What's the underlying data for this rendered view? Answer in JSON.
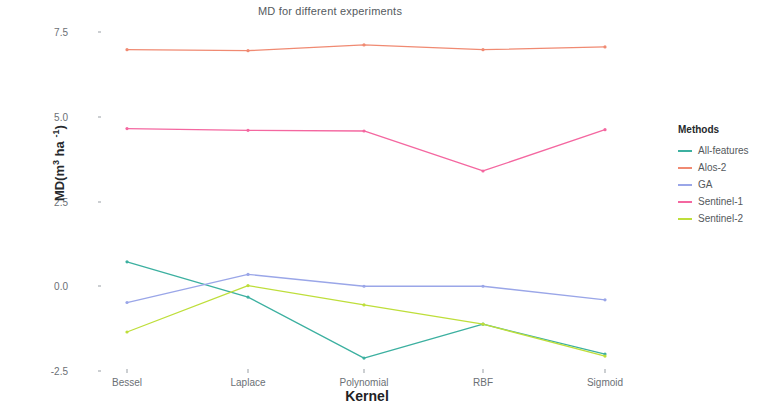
{
  "chart_data": {
    "type": "line",
    "title": "MD for different experiments",
    "xlabel": "Kernel",
    "ylabel": "MD(m3 ha-1)",
    "categories": [
      "Bessel",
      "Laplace",
      "Polynomial",
      "RBF",
      "Sigmoid"
    ],
    "ylim": [
      -2.5,
      7.5
    ],
    "yticks": [
      "7.5",
      "5.0",
      "2.5",
      "0.0",
      "-2.5"
    ],
    "ytick_values": [
      7.5,
      5.0,
      2.5,
      0.0,
      -2.5
    ],
    "grid": false,
    "legend_position": "right",
    "legend_title": "Methods",
    "series": [
      {
        "name": "All-features",
        "color": "#3cb0a0",
        "values": [
          0.72,
          -0.32,
          -2.12,
          -1.12,
          -2.0
        ]
      },
      {
        "name": "Alos-2",
        "color": "#f08a72",
        "values": [
          6.98,
          6.95,
          7.12,
          6.98,
          7.06
        ]
      },
      {
        "name": "GA",
        "color": "#9aa6e8",
        "values": [
          -0.48,
          0.35,
          0.0,
          0.0,
          -0.4
        ]
      },
      {
        "name": "Sentinel-1",
        "color": "#f467a0",
        "values": [
          4.65,
          4.6,
          4.58,
          3.4,
          4.62
        ]
      },
      {
        "name": "Sentinel-2",
        "color": "#bede3a",
        "values": [
          -1.35,
          0.02,
          -0.55,
          -1.12,
          -2.06
        ]
      }
    ]
  },
  "axis": {
    "y_title_main": "MD(m",
    "y_title_sup1": "3",
    "y_title_mid": " ha ",
    "y_title_sup2": "-1",
    "y_title_end": ")"
  }
}
